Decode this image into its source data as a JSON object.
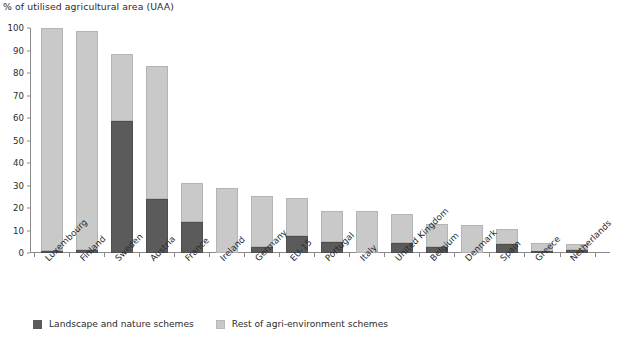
{
  "chart_data": {
    "type": "bar",
    "stacked": true,
    "title": "% of utilised agricultural area (UAA)",
    "xlabel": "",
    "ylabel": "% of utilised agricultural area (UAA)",
    "ylim": [
      0,
      100
    ],
    "yticks": [
      0,
      10,
      20,
      30,
      40,
      50,
      60,
      70,
      80,
      90,
      100
    ],
    "grid": false,
    "legend_position": "bottom-left",
    "categories": [
      "Luxembourg",
      "Finland",
      "Sweden",
      "Austria",
      "France",
      "Ireland",
      "Germany",
      "EU-15",
      "Portugal",
      "Italy",
      "United Kingdom",
      "Belgium",
      "Denmark",
      "Spain",
      "Greece",
      "Netherlands"
    ],
    "series": [
      {
        "name": "Landscape and nature schemes",
        "color": "#5b5b5b",
        "values": [
          0.8,
          1.5,
          58.5,
          23.8,
          14.0,
          0.0,
          2.5,
          7.5,
          5.0,
          0.0,
          4.5,
          2.5,
          0.0,
          4.0,
          0.5,
          1.5
        ]
      },
      {
        "name": "Rest of agri-environment schemes",
        "color": "#c9c9c9",
        "values": [
          99.4,
          97.3,
          29.8,
          59.2,
          17.3,
          28.8,
          22.8,
          17.0,
          13.8,
          18.5,
          13.0,
          10.5,
          12.5,
          6.5,
          4.0,
          2.6
        ]
      }
    ],
    "totals": [
      100.2,
      98.8,
      88.3,
      83.0,
      31.3,
      28.8,
      25.3,
      24.5,
      18.8,
      18.5,
      17.5,
      13.0,
      12.5,
      10.5,
      4.5,
      4.1
    ]
  },
  "legend": {
    "items": [
      {
        "label": "Landscape and nature schemes",
        "swatch": "dark"
      },
      {
        "label": "Rest of agri-environment schemes",
        "swatch": "light"
      }
    ]
  },
  "colors": {
    "dark": "#5b5b5b",
    "light": "#c9c9c9",
    "axis": "#8a8a8a",
    "text": "#2b2b2b",
    "background": "#ffffff"
  }
}
